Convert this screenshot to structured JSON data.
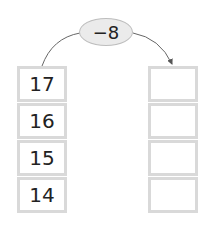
{
  "operation": {
    "label": "−8"
  },
  "left_column": {
    "values": [
      "17",
      "16",
      "15",
      "14"
    ]
  },
  "right_column": {
    "values": [
      "",
      "",
      "",
      ""
    ]
  },
  "colors": {
    "box_border": "#d9d9d9",
    "oval_fill": "#ebebeb",
    "arrow": "#555555"
  }
}
